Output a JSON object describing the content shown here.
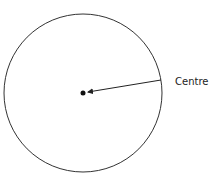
{
  "diagram": {
    "type": "circle-with-centre",
    "centre_label": "Centre",
    "circle": {
      "cx": 83,
      "cy": 93,
      "r": 79,
      "stroke": "#333333"
    },
    "centre_point": {
      "cx": 83,
      "cy": 93,
      "r": 2.5,
      "fill": "#111111"
    },
    "arrow": {
      "x1": 161,
      "y1": 80,
      "x2": 88,
      "y2": 92,
      "stroke": "#222222"
    },
    "label_position": {
      "x": 175,
      "y": 85
    }
  }
}
